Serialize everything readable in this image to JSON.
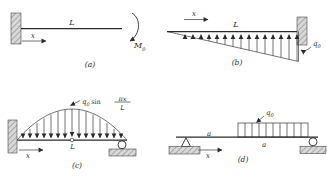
{
  "figure": {
    "panels": {
      "a": {
        "caption": "(a)",
        "beam_length": "L",
        "axis": "x",
        "moment_symbol": "M",
        "moment_sub": "0"
      },
      "b": {
        "caption": "(b)",
        "beam_length": "L",
        "axis": "x",
        "load_symbol": "q",
        "load_sub": "0"
      },
      "c": {
        "caption": "(c)",
        "midspan_label": "L",
        "axis": "x",
        "load_symbol": "q",
        "load_sub": "0",
        "func": "sin",
        "frac_num": "πx",
        "frac_den": "L"
      },
      "d": {
        "caption": "(d)",
        "axis": "x",
        "load_symbol": "q",
        "load_sub": "0",
        "dim_left": "a",
        "dim_right": "a"
      }
    }
  },
  "colors": {
    "ink": "#2a2a2a",
    "hatch_fill": "#d8d8d8",
    "hatch_line": "#777777",
    "background": "#ffffff"
  }
}
